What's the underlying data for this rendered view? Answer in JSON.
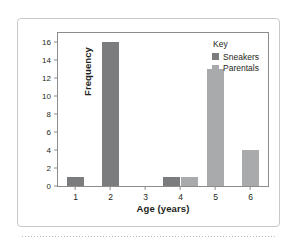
{
  "chart_data": {
    "type": "bar",
    "title": "",
    "xlabel": "Age (years)",
    "ylabel": "Frequency",
    "categories": [
      "1",
      "2",
      "3",
      "4",
      "5",
      "6"
    ],
    "series": [
      {
        "name": "Sneakers",
        "color": "#7a7c7e",
        "values": [
          1,
          16,
          0,
          1,
          0,
          0
        ]
      },
      {
        "name": "Parentals",
        "color": "#a8aaac",
        "values": [
          0,
          0,
          0,
          1,
          13,
          4
        ]
      }
    ],
    "ylim": [
      0,
      17
    ],
    "yticks": [
      0,
      2,
      4,
      6,
      8,
      10,
      12,
      14,
      16
    ],
    "ytick_labels": [
      "0",
      "2",
      "4",
      "6",
      "8",
      "10",
      "12",
      "14",
      "16"
    ],
    "grid": false,
    "legend_position": "top-right",
    "legend_title": "Key"
  },
  "legend": {
    "title": "Key",
    "entries": [
      {
        "label": "Sneakers",
        "color": "#7a7c7e"
      },
      {
        "label": "Parentals",
        "color": "#a8aaac"
      }
    ]
  },
  "colors": {
    "sneakers": "#7a7c7e",
    "parentals": "#a8aaac",
    "axis": "#8a8c8e",
    "card_border": "#c8c9cb",
    "text": "#231f20",
    "background": "#ffffff"
  }
}
